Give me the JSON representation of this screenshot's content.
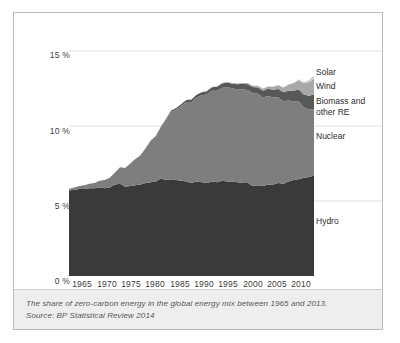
{
  "chart_data": {
    "type": "area",
    "stacked": true,
    "title": "",
    "xlabel": "",
    "ylabel": "",
    "xlim": [
      1965,
      2013
    ],
    "ylim": [
      0,
      16.2
    ],
    "grid": true,
    "grid_axis": "y",
    "legend_position": "right-inline",
    "y_ticks": [
      "0 %",
      "5 %",
      "10 %",
      "15 %"
    ],
    "y_tick_values": [
      0,
      5,
      10,
      15
    ],
    "x_ticks": [
      "1965",
      "1970",
      "1975",
      "1980",
      "1985",
      "1990",
      "1995",
      "2000",
      "2005",
      "2010"
    ],
    "x_tick_values": [
      1965,
      1970,
      1975,
      1980,
      1985,
      1990,
      1995,
      2000,
      2005,
      2010
    ],
    "x": [
      1965,
      1966,
      1967,
      1968,
      1969,
      1970,
      1971,
      1972,
      1973,
      1974,
      1975,
      1976,
      1977,
      1978,
      1979,
      1980,
      1981,
      1982,
      1983,
      1984,
      1985,
      1986,
      1987,
      1988,
      1989,
      1990,
      1991,
      1992,
      1993,
      1994,
      1995,
      1996,
      1997,
      1998,
      1999,
      2000,
      2001,
      2002,
      2003,
      2004,
      2005,
      2006,
      2007,
      2008,
      2009,
      2010,
      2011,
      2012,
      2013
    ],
    "series": [
      {
        "name": "Hydro",
        "color": "#3a3a3a",
        "values": [
          5.7,
          5.75,
          5.8,
          5.8,
          5.85,
          5.85,
          5.9,
          5.85,
          5.9,
          6.1,
          6.15,
          5.95,
          6.0,
          6.05,
          6.1,
          6.2,
          6.25,
          6.3,
          6.5,
          6.4,
          6.45,
          6.4,
          6.35,
          6.3,
          6.2,
          6.3,
          6.25,
          6.2,
          6.3,
          6.25,
          6.35,
          6.3,
          6.3,
          6.25,
          6.2,
          6.2,
          6.0,
          6.05,
          6.0,
          6.1,
          6.1,
          6.2,
          6.15,
          6.3,
          6.4,
          6.45,
          6.55,
          6.6,
          6.7
        ]
      },
      {
        "name": "Nuclear",
        "color": "#7e7e7e",
        "values": [
          0.1,
          0.15,
          0.2,
          0.25,
          0.3,
          0.35,
          0.45,
          0.55,
          0.65,
          0.8,
          1.1,
          1.25,
          1.5,
          1.75,
          1.95,
          2.3,
          2.75,
          3.0,
          3.4,
          4.0,
          4.5,
          4.7,
          5.0,
          5.3,
          5.4,
          5.6,
          5.8,
          5.9,
          6.05,
          6.1,
          6.2,
          6.3,
          6.2,
          6.2,
          6.25,
          6.2,
          6.2,
          6.1,
          5.9,
          5.9,
          5.8,
          5.7,
          5.5,
          5.4,
          5.25,
          5.2,
          4.7,
          4.5,
          4.4
        ]
      },
      {
        "name": "Biomass and other RE",
        "color": "#585858",
        "values": [
          0.0,
          0.0,
          0.0,
          0.0,
          0.0,
          0.0,
          0.0,
          0.0,
          0.0,
          0.0,
          0.0,
          0.0,
          0.0,
          0.0,
          0.0,
          0.02,
          0.03,
          0.04,
          0.05,
          0.06,
          0.08,
          0.1,
          0.12,
          0.14,
          0.16,
          0.18,
          0.2,
          0.22,
          0.24,
          0.26,
          0.28,
          0.3,
          0.32,
          0.34,
          0.36,
          0.38,
          0.4,
          0.42,
          0.45,
          0.48,
          0.52,
          0.56,
          0.6,
          0.65,
          0.7,
          0.78,
          0.85,
          0.92,
          1.0
        ]
      },
      {
        "name": "Wind",
        "color": "#a8a8a8",
        "values": [
          0.0,
          0.0,
          0.0,
          0.0,
          0.0,
          0.0,
          0.0,
          0.0,
          0.0,
          0.0,
          0.0,
          0.0,
          0.0,
          0.0,
          0.0,
          0.0,
          0.0,
          0.0,
          0.0,
          0.0,
          0.0,
          0.0,
          0.0,
          0.0,
          0.0,
          0.01,
          0.01,
          0.01,
          0.02,
          0.02,
          0.03,
          0.03,
          0.04,
          0.05,
          0.06,
          0.08,
          0.09,
          0.11,
          0.13,
          0.16,
          0.2,
          0.25,
          0.32,
          0.4,
          0.5,
          0.62,
          0.75,
          0.9,
          1.05
        ]
      },
      {
        "name": "Solar",
        "color": "#cfcfcf",
        "values": [
          0.0,
          0.0,
          0.0,
          0.0,
          0.0,
          0.0,
          0.0,
          0.0,
          0.0,
          0.0,
          0.0,
          0.0,
          0.0,
          0.0,
          0.0,
          0.0,
          0.0,
          0.0,
          0.0,
          0.0,
          0.0,
          0.0,
          0.0,
          0.0,
          0.0,
          0.0,
          0.0,
          0.0,
          0.0,
          0.0,
          0.0,
          0.0,
          0.0,
          0.0,
          0.0,
          0.0,
          0.0,
          0.0,
          0.0,
          0.01,
          0.01,
          0.01,
          0.02,
          0.03,
          0.04,
          0.06,
          0.09,
          0.14,
          0.2
        ]
      }
    ],
    "legend_entries": [
      {
        "label": "Solar",
        "color": "#cfcfcf"
      },
      {
        "label": "Wind",
        "color": "#a8a8a8"
      },
      {
        "label": "Biomass and",
        "color": "#585858"
      },
      {
        "label": "other RE",
        "color": "#585858"
      },
      {
        "label": "Nuclear",
        "color": "#7e7e7e"
      },
      {
        "label": "Hydro",
        "color": "#3a3a3a"
      }
    ]
  },
  "axis": {
    "y_ticks": [
      {
        "label": "15 %"
      },
      {
        "label": "10 %"
      },
      {
        "label": "5 %"
      },
      {
        "label": "0 %"
      }
    ],
    "x_ticks": [
      {
        "label": "1965"
      },
      {
        "label": "1970"
      },
      {
        "label": "1975"
      },
      {
        "label": "1980"
      },
      {
        "label": "1985"
      },
      {
        "label": "1990"
      },
      {
        "label": "1995"
      },
      {
        "label": "2000"
      },
      {
        "label": "2005"
      },
      {
        "label": "2010"
      }
    ]
  },
  "legend": {
    "solar": "Solar",
    "wind": "Wind",
    "biomass_line1": "Biomass and",
    "biomass_line2": "other RE",
    "nuclear": "Nuclear",
    "hydro": "Hydro"
  },
  "caption": {
    "line1": "The share of zero-carbon energy in the global energy mix between 1965 and 2013.",
    "line2": "Source: BP Statistical Review 2014"
  },
  "colors": {
    "hydro": "#3a3a3a",
    "nuclear": "#7e7e7e",
    "biomass": "#585858",
    "wind": "#a8a8a8",
    "solar": "#cfcfcf",
    "grid": "#d8d8d8",
    "frame": "#b9b9b9",
    "caption_bg": "#eeeeee"
  }
}
